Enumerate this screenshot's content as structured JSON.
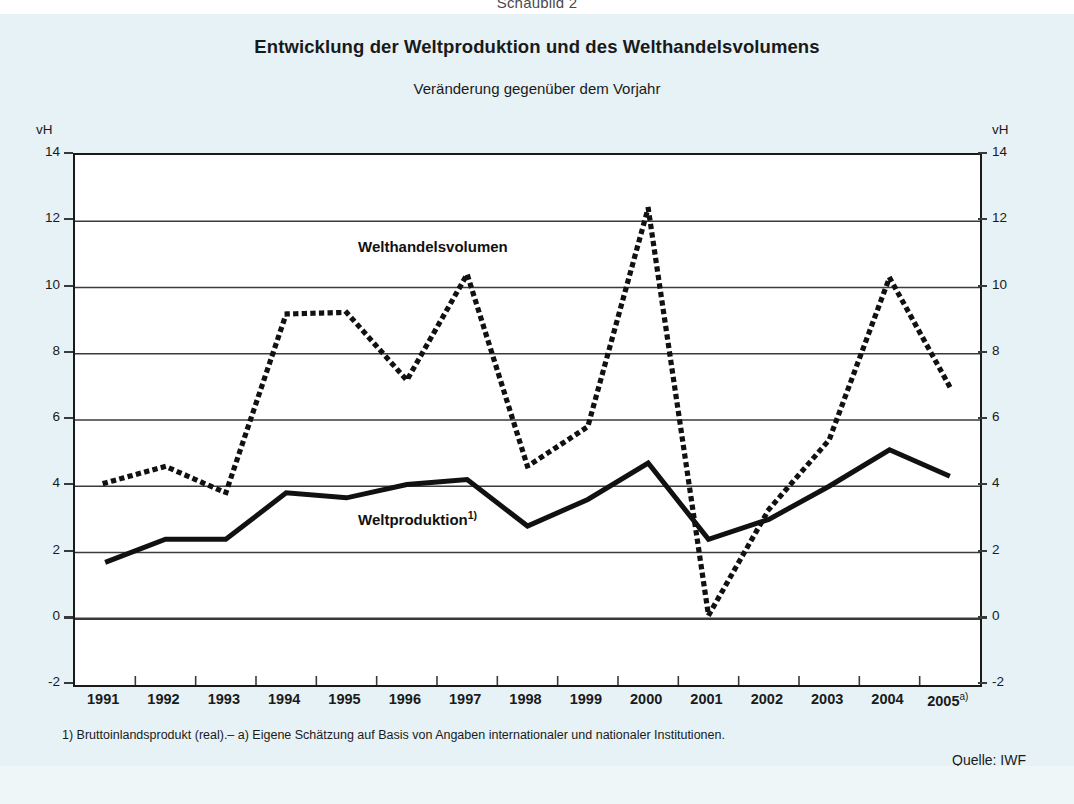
{
  "header": {
    "schaubild": "Schaubild 2",
    "title": "Entwicklung der Weltproduktion und des Welthandelsvolumens",
    "subtitle": "Veränderung gegenüber dem Vorjahr"
  },
  "axes": {
    "unit_left": "vH",
    "unit_right": "vH",
    "y_ticks": [
      "14",
      "12",
      "10",
      "8",
      "6",
      "4",
      "2",
      "0",
      "-2"
    ],
    "x_ticks": [
      {
        "label": "1991",
        "sup": ""
      },
      {
        "label": "1992",
        "sup": ""
      },
      {
        "label": "1993",
        "sup": ""
      },
      {
        "label": "1994",
        "sup": ""
      },
      {
        "label": "1995",
        "sup": ""
      },
      {
        "label": "1996",
        "sup": ""
      },
      {
        "label": "1997",
        "sup": ""
      },
      {
        "label": "1998",
        "sup": ""
      },
      {
        "label": "1999",
        "sup": ""
      },
      {
        "label": "2000",
        "sup": ""
      },
      {
        "label": "2001",
        "sup": ""
      },
      {
        "label": "2002",
        "sup": ""
      },
      {
        "label": "2003",
        "sup": ""
      },
      {
        "label": "2004",
        "sup": ""
      },
      {
        "label": "2005",
        "sup": "a)"
      }
    ]
  },
  "series_labels": {
    "welthandel": "Welthandelsvolumen",
    "weltproduktion": "Weltproduktion",
    "weltproduktion_sup": "1)"
  },
  "notes": {
    "footnote": "1) Bruttoinlandsprodukt (real).– a) Eigene Schätzung auf Basis von Angaben internationaler und nationaler Institutionen.",
    "source": "Quelle: IWF",
    "copyright": "© Sachverständigenrat"
  },
  "colors": {
    "page_background": "#e6f2f6",
    "plot_background": "#ffffff",
    "line": "#111111",
    "grid": "#3a3a3a",
    "text": "#1a1a1a"
  },
  "chart_data": {
    "type": "line",
    "title": "Entwicklung der Weltproduktion und des Welthandelsvolumens",
    "subtitle": "Veränderung gegenüber dem Vorjahr",
    "xlabel": "",
    "ylabel": "vH",
    "ylim": [
      -2,
      14
    ],
    "y_ticks": [
      -2,
      0,
      2,
      4,
      6,
      8,
      10,
      12,
      14
    ],
    "grid": true,
    "legend": "inline-annotations",
    "categories": [
      1991,
      1992,
      1993,
      1994,
      1995,
      1996,
      1997,
      1998,
      1999,
      2000,
      2001,
      2002,
      2003,
      2004,
      2005
    ],
    "series": [
      {
        "name": "Welthandelsvolumen",
        "style": "dotted",
        "values": [
          4.1,
          4.6,
          3.8,
          9.2,
          9.25,
          7.2,
          10.4,
          4.6,
          5.8,
          12.4,
          0.1,
          3.3,
          5.4,
          10.3,
          7.0
        ]
      },
      {
        "name": "Weltproduktion",
        "style": "solid",
        "note_ref": "1)",
        "values": [
          1.7,
          2.4,
          2.4,
          3.8,
          3.65,
          4.05,
          4.2,
          2.8,
          3.6,
          4.7,
          2.4,
          3.0,
          4.0,
          5.1,
          4.3
        ]
      }
    ],
    "annotations": [
      {
        "text": "Welthandelsvolumen",
        "x": 1996.0,
        "y": 11.1
      },
      {
        "text": "Weltproduktion1)",
        "x": 1996.0,
        "y": 2.9
      }
    ]
  }
}
